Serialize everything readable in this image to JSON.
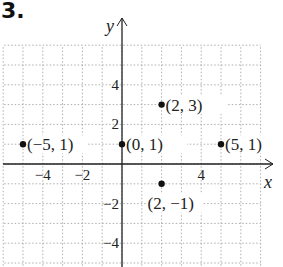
{
  "problem_number": "3.",
  "chart_data": {
    "type": "scatter",
    "title": "",
    "xlabel": "x",
    "ylabel": "y",
    "xlim": [
      -6,
      7
    ],
    "ylim": [
      -6,
      6
    ],
    "grid": true,
    "x_ticks": [
      {
        "value": -4,
        "label": "−4"
      },
      {
        "value": -2,
        "label": "−2"
      },
      {
        "value": 4,
        "label": "4"
      }
    ],
    "y_ticks": [
      {
        "value": 4,
        "label": "4"
      },
      {
        "value": 2,
        "label": "2"
      },
      {
        "value": -2,
        "label": "−2"
      },
      {
        "value": -4,
        "label": "−4"
      }
    ],
    "points": [
      {
        "x": -5,
        "y": 1,
        "label": "(−5, 1)"
      },
      {
        "x": 0,
        "y": 1,
        "label": "(0, 1)"
      },
      {
        "x": 2,
        "y": 3,
        "label": "(2, 3)"
      },
      {
        "x": 5,
        "y": 1,
        "label": "(5, 1)"
      },
      {
        "x": 2,
        "y": -1,
        "label": "(2, −1)"
      }
    ]
  }
}
